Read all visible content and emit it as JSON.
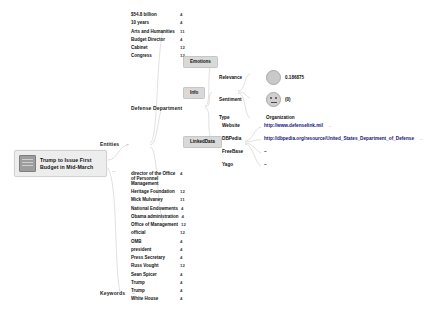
{
  "graph": {
    "root": {
      "title": "Trump to Issue First Budget in Mid-March",
      "thumb_icon": "document-thumbnail-icon",
      "collapse_toggle": "–"
    },
    "branches": {
      "entities_label": "Entities",
      "entities_toggle": "–",
      "keywords_label": "Keywords",
      "keywords_toggle": "–"
    },
    "pills": {
      "emotions": "Emotions",
      "info": "Info",
      "linkeddata": "LinkedData"
    },
    "focused_entity": "Defense Department"
  },
  "top_entities": [
    {
      "name": "$54.8 billion",
      "count": "4"
    },
    {
      "name": "10 years",
      "count": "4"
    },
    {
      "name": "Arts and Humanities",
      "count": "11"
    },
    {
      "name": "Budget Director",
      "count": "4"
    },
    {
      "name": "Cabinet",
      "count": "12"
    },
    {
      "name": "Congress",
      "count": "12"
    }
  ],
  "bottom_entities": [
    {
      "name": "director of the Office of Personnel Management",
      "count": "4"
    },
    {
      "name": "Heritage Foundation",
      "count": "12"
    },
    {
      "name": "Mick Mulvaney",
      "count": "11"
    },
    {
      "name": "National Endowments",
      "count": "4"
    },
    {
      "name": "Obama administration",
      "count": "4"
    },
    {
      "name": "Office of Management",
      "count": "12"
    },
    {
      "name": "official",
      "count": "12"
    },
    {
      "name": "OMB",
      "count": "4"
    },
    {
      "name": "president",
      "count": "4"
    },
    {
      "name": "Press Secretary",
      "count": "4"
    },
    {
      "name": "Russ Vought",
      "count": "12"
    },
    {
      "name": "Sean Spicer",
      "count": "4"
    },
    {
      "name": "Trump",
      "count": "4"
    },
    {
      "name": "Trump",
      "count": "4"
    },
    {
      "name": "White House",
      "count": "4"
    }
  ],
  "info": {
    "relevance_label": "Relevance",
    "relevance_value": "0.186875",
    "relevance_icon": "relevance-gauge-icon",
    "sentiment_label": "Sentiment",
    "sentiment_value": "(0)",
    "sentiment_icon": "neutral-face-icon",
    "type_label": "Type",
    "type_value": "Organization"
  },
  "linkeddata": [
    {
      "label": "Website",
      "value": "http://www.defenselink.mil",
      "more": "–",
      "is_link": true
    },
    {
      "label": "DBPedia",
      "value": "http://dbpedia.org/resource/United_States_Department_of_Defense",
      "more": "–",
      "is_link": true
    },
    {
      "label": "FreeBase",
      "value": "–",
      "more": "",
      "is_link": false
    },
    {
      "label": "Yago",
      "value": "–",
      "more": "",
      "is_link": false
    }
  ],
  "colors": {
    "pill_bg": "#d9d9d9",
    "root_bg": "#ededed",
    "edge": "#d8d8d8",
    "link": "#15137c"
  }
}
